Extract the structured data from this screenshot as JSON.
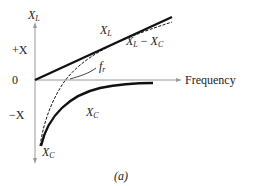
{
  "figure": {
    "caption": "(a)",
    "axes": {
      "y_top_label": "X",
      "y_top_sub": "L",
      "y_bottom_label": "X",
      "y_bottom_sub": "C",
      "plus_label": "+X",
      "zero_label": "0",
      "minus_label": "−X",
      "x_label": "Frequency"
    },
    "curves": {
      "xl_label": "X",
      "xl_sub": "L",
      "net_label_a": "X",
      "net_sub_a": "L",
      "net_minus": "−",
      "net_label_b": "X",
      "net_sub_b": "C",
      "xc_label": "X",
      "xc_sub": "C",
      "fr_label": "f",
      "fr_sub": "r"
    },
    "colors": {
      "axis": "#9a9a9a",
      "curve": "#111111",
      "text": "#222222"
    }
  }
}
